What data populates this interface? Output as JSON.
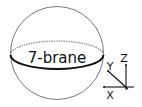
{
  "diagram": {
    "brane_label": "7-brane",
    "axes": {
      "x_label": "X",
      "y_label": "Y",
      "z_label": "Z"
    },
    "colors": {
      "sphere_outline": "#555555",
      "equator_front": "#111111",
      "equator_back": "#888888",
      "axes": "#111111"
    }
  }
}
